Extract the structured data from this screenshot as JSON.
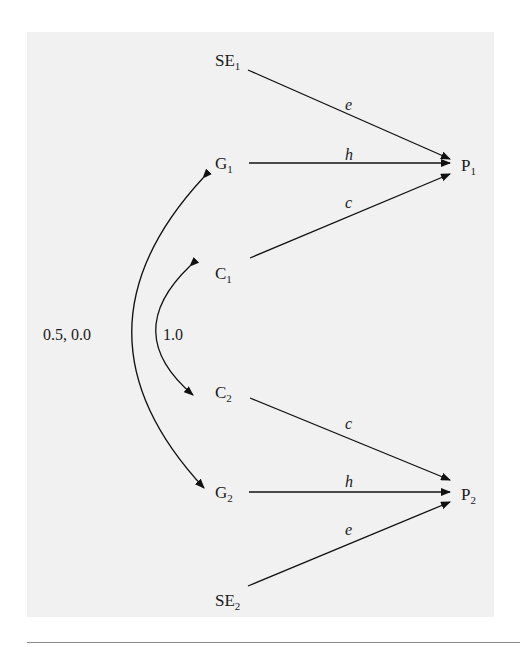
{
  "diagram": {
    "type": "path-diagram",
    "nodes": [
      {
        "id": "SE1",
        "base": "SE",
        "sub": "1"
      },
      {
        "id": "G1",
        "base": "G",
        "sub": "1"
      },
      {
        "id": "C1",
        "base": "C",
        "sub": "1"
      },
      {
        "id": "C2",
        "base": "C",
        "sub": "2"
      },
      {
        "id": "G2",
        "base": "G",
        "sub": "2"
      },
      {
        "id": "SE2",
        "base": "SE",
        "sub": "2"
      },
      {
        "id": "P1",
        "base": "P",
        "sub": "1"
      },
      {
        "id": "P2",
        "base": "P",
        "sub": "2"
      }
    ],
    "paths": [
      {
        "from": "SE1",
        "to": "P1",
        "label": "e"
      },
      {
        "from": "G1",
        "to": "P1",
        "label": "h"
      },
      {
        "from": "C1",
        "to": "P1",
        "label": "c"
      },
      {
        "from": "C2",
        "to": "P2",
        "label": "c"
      },
      {
        "from": "G2",
        "to": "P2",
        "label": "h"
      },
      {
        "from": "SE2",
        "to": "P2",
        "label": "e"
      }
    ],
    "correlations": [
      {
        "between": [
          "G1",
          "G2"
        ],
        "label": "0.5, 0.0"
      },
      {
        "between": [
          "C1",
          "C2"
        ],
        "label": "1.0"
      }
    ]
  }
}
